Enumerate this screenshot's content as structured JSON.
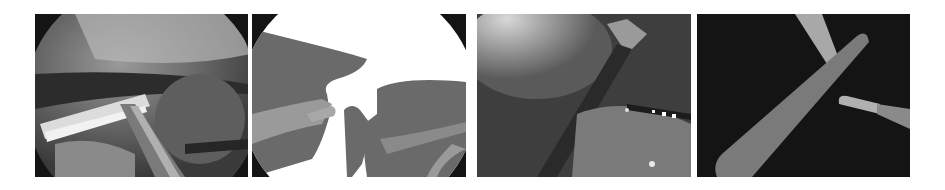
{
  "figure": {
    "panels": [
      {
        "id": "p1",
        "kind": "endoscopic-image",
        "view": "circular"
      },
      {
        "id": "p2",
        "kind": "segmentation-mask",
        "view": "circular"
      },
      {
        "id": "p3",
        "kind": "endoscopic-image",
        "view": "full-frame"
      },
      {
        "id": "p4",
        "kind": "segmentation-mask",
        "view": "full-frame"
      }
    ],
    "colors": {
      "background": "#ffffff",
      "frame_black": "#141414",
      "mask_dark_gray": "#6a6a6a",
      "mask_mid_gray": "#8a8a8a",
      "mask_light_gray": "#a8a8a8",
      "mask_white": "#ffffff"
    }
  }
}
